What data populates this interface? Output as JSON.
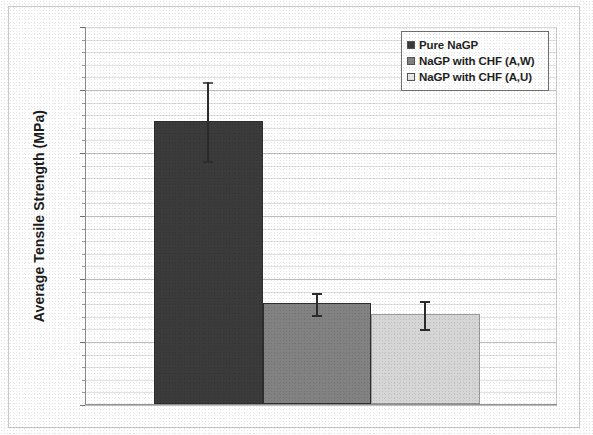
{
  "figure": {
    "frame_border_color": "#c9c9c9",
    "background": "#ffffff"
  },
  "chart_data": {
    "type": "bar",
    "title": "",
    "xlabel": "",
    "ylabel": "Average Tensile Strength (MPa)",
    "ylim": [
      0,
      12
    ],
    "ytick_step": 2,
    "yticks": [
      "12",
      "10",
      "8",
      "6",
      "4",
      "2",
      "0"
    ],
    "ytick_values": [
      12,
      10,
      8,
      6,
      4,
      2,
      0
    ],
    "minor_gridlines": true,
    "minor_gridline_step": 0.4,
    "grid": true,
    "legend_position": "top-right",
    "categories": [
      "Pure NaGP",
      "NaGP with CHF (A,W)",
      "NaGP with CHF (A,U)"
    ],
    "values": [
      9.0,
      3.2,
      2.85
    ],
    "errors": [
      1.25,
      0.35,
      0.45
    ],
    "error_low": [
      7.75,
      2.85,
      2.4
    ],
    "error_high": [
      10.25,
      3.55,
      3.3
    ],
    "colors": [
      "#3b3b3b",
      "#828282",
      "#d6d6d6"
    ],
    "bars": [
      {
        "label": "Pure NaGP",
        "value": 9.0,
        "error": 1.25,
        "color": "#3b3b3b"
      },
      {
        "label": "NaGP with CHF (A,W)",
        "value": 3.2,
        "error": 0.35,
        "color": "#828282"
      },
      {
        "label": "NaGP with CHF (A,U)",
        "value": 2.85,
        "error": 0.45,
        "color": "#d6d6d6"
      }
    ]
  },
  "legend": {
    "items": [
      {
        "label": "Pure NaGP",
        "color": "#3b3b3b"
      },
      {
        "label": "NaGP with CHF (A,W)",
        "color": "#828282"
      },
      {
        "label": "NaGP with CHF (A,U)",
        "color": "#e8e8e8"
      }
    ]
  },
  "axis": {
    "y_title": "Average Tensile Strength (MPa)"
  }
}
